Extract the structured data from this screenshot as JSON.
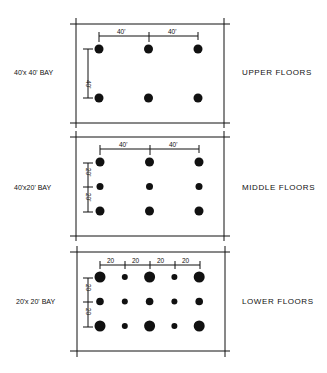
{
  "panels": [
    {
      "bay_label": "40'x 40' BAY",
      "floor_label": "UPPER FLOORS",
      "top_dims": [
        "40'",
        "40'"
      ],
      "side_dims": [
        "40'"
      ],
      "grid": {
        "cols": 3,
        "rows": 2,
        "sizes": [
          [
            4.5,
            4.5,
            4.5
          ],
          [
            4.5,
            4.5,
            4.5
          ]
        ]
      }
    },
    {
      "bay_label": "40'x20' BAY",
      "floor_label": "MIDDLE FLOORS",
      "top_dims": [
        "40'",
        "40'"
      ],
      "side_dims": [
        "20'",
        "20'"
      ],
      "grid": {
        "cols": 3,
        "rows": 3,
        "sizes": [
          [
            4.5,
            4.5,
            4.5
          ],
          [
            3.5,
            3.5,
            3.5
          ],
          [
            4.5,
            4.5,
            4.5
          ]
        ]
      }
    },
    {
      "bay_label": "20'x 20' BAY",
      "floor_label": "LOWER FLOORS",
      "top_dims": [
        "20",
        "20",
        "20",
        "20"
      ],
      "side_dims": [
        "20",
        "20"
      ],
      "grid": {
        "cols": 5,
        "rows": 3,
        "sizes": [
          [
            5.5,
            3,
            5.5,
            3,
            5.5
          ],
          [
            3.8,
            3,
            3.8,
            3,
            3.8
          ],
          [
            5.5,
            3,
            5.5,
            3,
            5.5
          ]
        ]
      }
    }
  ]
}
